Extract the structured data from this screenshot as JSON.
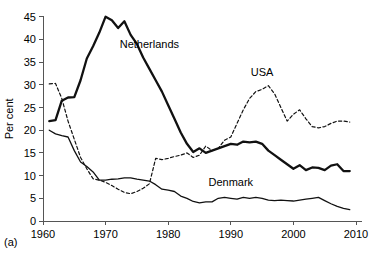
{
  "panel": {
    "tag": "(a)"
  },
  "chart_data": {
    "type": "line",
    "title": "",
    "xlabel": "",
    "ylabel": "Per cent",
    "xlim": [
      1960,
      2010
    ],
    "ylim": [
      0,
      45
    ],
    "xticks": [
      1960,
      1970,
      1980,
      1990,
      2000,
      2010
    ],
    "yticks": [
      0,
      5,
      10,
      15,
      20,
      25,
      30,
      35,
      40,
      45
    ],
    "grid": false,
    "legend": "inline-annotations",
    "annotations": [
      {
        "text": "Netherlands",
        "x": 1977.0,
        "y": 38.0
      },
      {
        "text": "USA",
        "x": 1995.0,
        "y": 32.0
      },
      {
        "text": "Denmark",
        "x": 1990.0,
        "y": 7.8
      }
    ],
    "series": [
      {
        "name": "Netherlands",
        "style": "solid-thick",
        "x": [
          1961,
          1962,
          1963,
          1964,
          1965,
          1966,
          1967,
          1968,
          1969,
          1970,
          1971,
          1972,
          1973,
          1974,
          1975,
          1976,
          1977,
          1978,
          1979,
          1980,
          1981,
          1982,
          1983,
          1984,
          1985,
          1986,
          1987,
          1988,
          1989,
          1990,
          1991,
          1992,
          1993,
          1994,
          1995,
          1996,
          1997,
          1998,
          1999,
          2000,
          2001,
          2002,
          2003,
          2004,
          2005,
          2006,
          2007,
          2008,
          2009
        ],
        "values": [
          22.0,
          22.2,
          26.5,
          27.2,
          27.3,
          31.0,
          35.8,
          38.5,
          41.5,
          45.0,
          44.2,
          42.5,
          44.0,
          41.0,
          39.0,
          36.0,
          33.5,
          31.0,
          28.5,
          25.5,
          22.5,
          19.5,
          17.0,
          15.2,
          16.0,
          15.0,
          15.5,
          16.0,
          16.5,
          17.0,
          16.8,
          17.5,
          17.3,
          17.5,
          17.0,
          15.5,
          14.5,
          13.5,
          12.5,
          11.5,
          12.3,
          11.2,
          11.8,
          11.7,
          11.2,
          12.2,
          12.5,
          11.0,
          11.0
        ]
      },
      {
        "name": "USA",
        "style": "dashed",
        "x": [
          1961,
          1962,
          1963,
          1964,
          1965,
          1966,
          1967,
          1968,
          1969,
          1970,
          1971,
          1972,
          1973,
          1974,
          1975,
          1976,
          1977,
          1978,
          1979,
          1980,
          1981,
          1982,
          1983,
          1984,
          1985,
          1986,
          1987,
          1988,
          1989,
          1990,
          1991,
          1992,
          1993,
          1994,
          1995,
          1996,
          1997,
          1998,
          1999,
          2000,
          2001,
          2002,
          2003,
          2004,
          2005,
          2006,
          2007,
          2008,
          2009
        ],
        "values": [
          30.2,
          30.3,
          27.0,
          22.0,
          18.0,
          14.0,
          11.5,
          9.3,
          9.0,
          8.5,
          7.8,
          7.0,
          6.3,
          6.0,
          6.5,
          7.2,
          8.2,
          13.8,
          13.5,
          13.8,
          14.2,
          14.5,
          15.0,
          14.0,
          14.5,
          16.5,
          15.5,
          16.0,
          17.8,
          18.5,
          21.5,
          24.5,
          27.0,
          28.5,
          29.0,
          29.8,
          28.0,
          25.0,
          22.0,
          23.5,
          24.5,
          22.5,
          20.8,
          20.5,
          20.8,
          21.5,
          22.0,
          22.0,
          21.8
        ]
      },
      {
        "name": "Denmark",
        "style": "solid-thin",
        "x": [
          1961,
          1962,
          1963,
          1964,
          1965,
          1966,
          1967,
          1968,
          1969,
          1970,
          1971,
          1972,
          1973,
          1974,
          1975,
          1976,
          1977,
          1978,
          1979,
          1980,
          1981,
          1982,
          1983,
          1984,
          1985,
          1986,
          1987,
          1988,
          1989,
          1990,
          1991,
          1992,
          1993,
          1994,
          1995,
          1996,
          1997,
          1998,
          1999,
          2000,
          2001,
          2002,
          2003,
          2004,
          2005,
          2006,
          2007,
          2008,
          2009
        ],
        "values": [
          20.0,
          19.2,
          18.8,
          18.5,
          15.5,
          13.0,
          12.0,
          10.8,
          9.0,
          9.0,
          9.2,
          9.3,
          9.5,
          9.5,
          9.2,
          9.0,
          8.8,
          8.0,
          7.0,
          6.8,
          6.5,
          5.5,
          5.0,
          4.3,
          4.0,
          4.2,
          4.2,
          5.0,
          5.2,
          5.0,
          4.8,
          5.2,
          5.0,
          5.2,
          5.0,
          4.6,
          4.5,
          4.6,
          4.5,
          4.4,
          4.6,
          4.8,
          5.0,
          5.2,
          4.5,
          3.8,
          3.2,
          2.8,
          2.5
        ]
      }
    ]
  }
}
